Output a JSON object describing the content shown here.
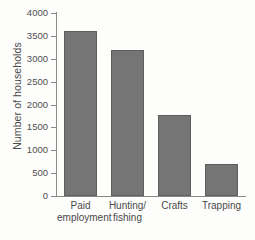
{
  "chart_data": {
    "type": "bar",
    "title": "",
    "xlabel": "",
    "ylabel": "Number of households",
    "categories": [
      "Paid\nemployment",
      "Hunting/\nfishing",
      "Crafts",
      "Trapping"
    ],
    "values": [
      3600,
      3200,
      1760,
      700
    ],
    "ylim": [
      0,
      4000
    ],
    "ytick_labels": [
      "4000",
      "3500",
      "3000",
      "2500",
      "2000",
      "1500",
      "1000",
      "500",
      "0"
    ],
    "ytick_values": [
      4000,
      3500,
      3000,
      2500,
      2000,
      1500,
      1000,
      500,
      0
    ],
    "grid": false,
    "legend": false,
    "legend_position": "none",
    "bar_color": "#757575",
    "bar_edge_color": "#5e5e5e",
    "axis_color": "#8a8a8a",
    "text_color": "#4a4a4a",
    "background_color": "#fdfdfc"
  }
}
